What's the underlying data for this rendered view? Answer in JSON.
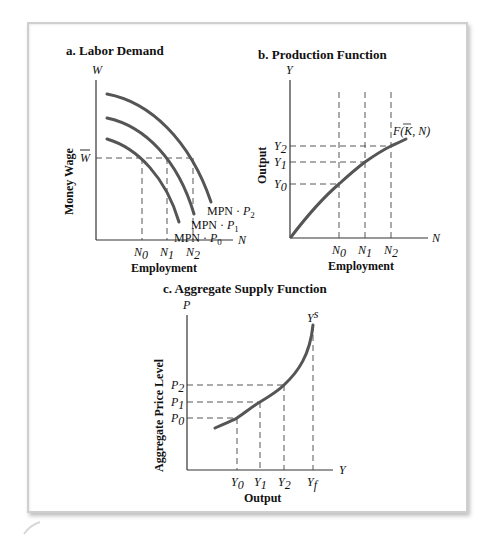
{
  "figure": {
    "panels": [
      {
        "id": "a",
        "title": "a.  Labor Demand",
        "y_axis_symbol": "W",
        "x_axis_symbol": "N",
        "y_label": "Money Wage",
        "x_label": "Employment",
        "y_tick": "W̄",
        "x_ticks": [
          "N0",
          "N1",
          "N2"
        ],
        "curves": [
          "MPN · P2",
          "MPN · P1",
          "MPN · P0"
        ]
      },
      {
        "id": "b",
        "title": "b.  Production Function",
        "y_axis_symbol": "Y",
        "x_axis_symbol": "N",
        "y_label": "Output",
        "x_label": "Employment",
        "y_ticks": [
          "Y2",
          "Y1",
          "Y0"
        ],
        "x_ticks": [
          "N0",
          "N1",
          "N2"
        ],
        "curve_label": "F(K̄, N)"
      },
      {
        "id": "c",
        "title": "c.  Aggregate Supply Function",
        "y_axis_symbol": "P",
        "x_axis_symbol": "Y",
        "y_label": "Aggregate Price Level",
        "x_label": "Output",
        "y_ticks": [
          "P2",
          "P1",
          "P0"
        ],
        "x_ticks": [
          "Y0",
          "Y1",
          "Y2",
          "Yf"
        ],
        "curve_label": "Ys"
      }
    ]
  },
  "labels": {
    "a_title": "a.  Labor Demand",
    "a_W": "W",
    "a_N": "N",
    "a_ylabel": "Money Wage",
    "a_xlabel": "Employment",
    "a_wbar": "W",
    "a_n0": "N",
    "a_n0_sub": "0",
    "a_n1": "N",
    "a_n1_sub": "1",
    "a_n2": "N",
    "a_n2_sub": "2",
    "a_mpn": "MPN · ",
    "a_p": "P",
    "a_p2_sub": "2",
    "a_p1_sub": "1",
    "a_p0_sub": "0",
    "b_title": "b.  Production Function",
    "b_Y": "Y",
    "b_N": "N",
    "b_ylabel": "Output",
    "b_xlabel": "Employment",
    "b_y": "Y",
    "b_y2_sub": "2",
    "b_y1_sub": "1",
    "b_y0_sub": "0",
    "b_n": "N",
    "b_n0_sub": "0",
    "b_n1_sub": "1",
    "b_n2_sub": "2",
    "b_f": "F(",
    "b_k": "K",
    "b_fend": ", N)",
    "c_title": "c.  Aggregate Supply Function",
    "c_P": "P",
    "c_Y": "Y",
    "c_ylabel": "Aggregate Price Level",
    "c_xlabel": "Output",
    "c_p": "P",
    "c_p2_sub": "2",
    "c_p1_sub": "1",
    "c_p0_sub": "0",
    "c_y": "Y",
    "c_y0_sub": "0",
    "c_y1_sub": "1",
    "c_y2_sub": "2",
    "c_yf_sub": "f",
    "c_ys": "Y",
    "c_ys_sup": "s"
  }
}
